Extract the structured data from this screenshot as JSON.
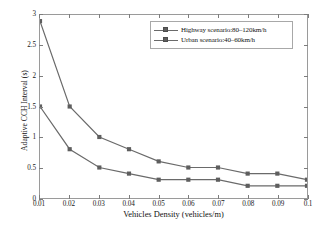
{
  "chart_data": {
    "type": "line",
    "title": "",
    "xlabel": "Vehicles Density (vehicles/m)",
    "ylabel": "Adaptive CCH Interval (s)",
    "x": [
      0.01,
      0.02,
      0.03,
      0.04,
      0.05,
      0.06,
      0.07,
      0.08,
      0.09,
      0.1
    ],
    "xlim": [
      0.01,
      0.1
    ],
    "ylim": [
      0,
      3
    ],
    "xticks": [
      "0.01",
      "0.02",
      "0.03",
      "0.04",
      "0.05",
      "0.06",
      "0.07",
      "0.08",
      "0.09",
      "0.1"
    ],
    "yticks": [
      "0",
      "0.5",
      "1",
      "1.5",
      "2",
      "2.5",
      "3"
    ],
    "grid": false,
    "legend_position": "top-right",
    "series": [
      {
        "name": "Highway scenario:80–120km/h",
        "color": "#6a6a6a",
        "marker": "square",
        "values": [
          2.9,
          1.5,
          1.0,
          0.8,
          0.6,
          0.5,
          0.5,
          0.4,
          0.4,
          0.3
        ]
      },
      {
        "name": "Urban scenario:40–60km/h",
        "color": "#6a6a6a",
        "marker": "square",
        "values": [
          1.5,
          0.8,
          0.5,
          0.4,
          0.3,
          0.3,
          0.3,
          0.2,
          0.2,
          0.2
        ]
      }
    ]
  },
  "legend": {
    "items": [
      {
        "label": "Highway scenario:80–120km/h"
      },
      {
        "label": "Urban scenario:40–60km/h"
      }
    ]
  },
  "colors": {
    "line": "#6a6a6a",
    "marker": "#5e5e5e",
    "axis": "#9a9a9a",
    "text": "#141414"
  }
}
